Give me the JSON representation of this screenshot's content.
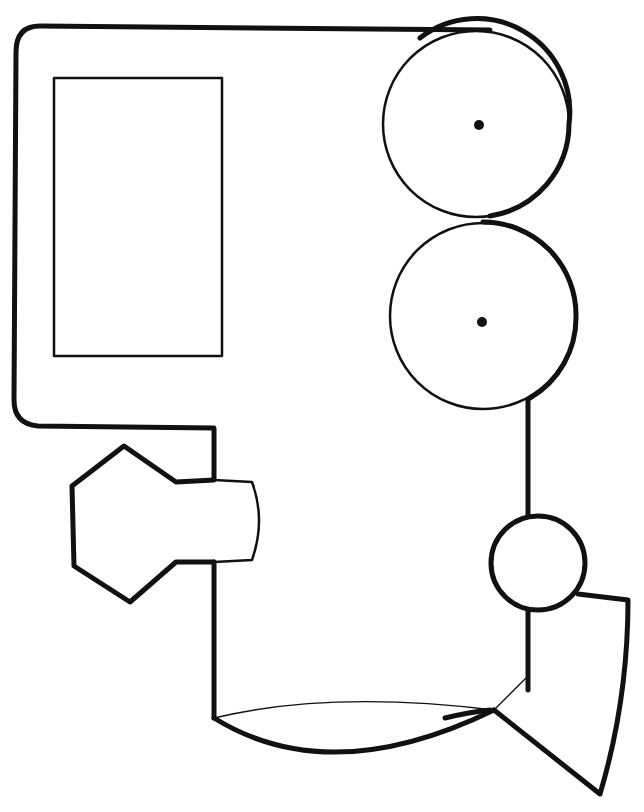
{
  "drawing": {
    "subject": "train-engine-coloring-page",
    "background": "#ffffff",
    "stroke": "#111111",
    "parts": [
      {
        "id": "cab-body",
        "type": "outline"
      },
      {
        "id": "cab-window",
        "type": "rectangle"
      },
      {
        "id": "wheel-top",
        "type": "circle",
        "axle": true
      },
      {
        "id": "wheel-bottom",
        "type": "circle",
        "axle": true
      },
      {
        "id": "coupler",
        "type": "hexagon-with-stem"
      },
      {
        "id": "headlight",
        "type": "circle"
      },
      {
        "id": "cowcatcher",
        "type": "funnel"
      },
      {
        "id": "boiler-base",
        "type": "lens"
      }
    ]
  }
}
